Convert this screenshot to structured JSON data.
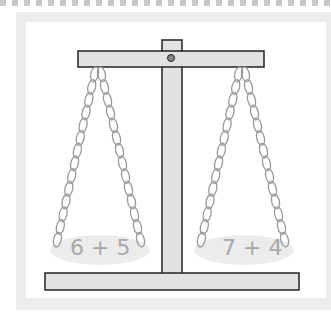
{
  "left_pan": {
    "expression": "6 + 5"
  },
  "right_pan": {
    "expression": "7 + 4"
  },
  "colors": {
    "beam": "#e2e2e2",
    "outline": "#222222",
    "chain": "#9a9a9a",
    "pan": "#ececec",
    "text": "#a8a8a8"
  }
}
